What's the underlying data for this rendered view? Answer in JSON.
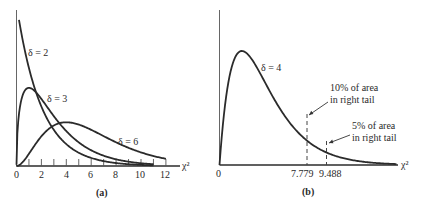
{
  "chart_data": [
    {
      "type": "line",
      "panel_label": "(a)",
      "title": "",
      "xlabel": "χ²",
      "ylabel": "",
      "xlim": [
        0,
        13
      ],
      "x_ticks": [
        0,
        1,
        2,
        3,
        4,
        5,
        6,
        7,
        8,
        9,
        10,
        11,
        12
      ],
      "x_tick_labels": [
        "0",
        "2",
        "4",
        "6",
        "8",
        "10",
        "12"
      ],
      "grid": false,
      "legend": "inline labels",
      "series": [
        {
          "name": "δ = 2",
          "label": "δ = 2",
          "distribution": "chi-square",
          "df": 2,
          "x_range": [
            0.2,
            11
          ]
        },
        {
          "name": "δ = 3",
          "label": "δ = 3",
          "distribution": "chi-square",
          "df": 3,
          "x_range": [
            0,
            11
          ]
        },
        {
          "name": "δ = 6",
          "label": "δ = 6",
          "distribution": "chi-square",
          "df": 6,
          "x_range": [
            0,
            12
          ]
        }
      ]
    },
    {
      "type": "line",
      "panel_label": "(b)",
      "title": "",
      "xlabel": "χ²",
      "ylabel": "",
      "xlim": [
        0,
        16
      ],
      "x_tick_labels": [
        "0",
        "7.779",
        "9.488"
      ],
      "grid": false,
      "series": [
        {
          "name": "δ = 4",
          "label": "δ = 4",
          "distribution": "chi-square",
          "df": 4,
          "x_range": [
            0,
            15.8
          ]
        }
      ],
      "critical_values": [
        {
          "x": 7.779,
          "label": "7.779",
          "annotation": [
            "10% of area",
            "in right tail"
          ]
        },
        {
          "x": 9.488,
          "label": "9.488",
          "annotation": [
            "5% of area",
            "in right tail"
          ]
        }
      ]
    }
  ],
  "panel_a": {
    "caption": "(a)",
    "axis_label": "χ²",
    "tick_labels": [
      "0",
      "2",
      "4",
      "6",
      "8",
      "10",
      "12"
    ],
    "curve_labels": [
      "δ = 2",
      "δ = 3",
      "δ = 6"
    ]
  },
  "panel_b": {
    "caption": "(b)",
    "axis_label": "χ²",
    "origin_label": "0",
    "curve_label": "δ = 4",
    "crit1_label": "7.779",
    "crit2_label": "9.488",
    "note1_line1": "10% of area",
    "note1_line2": "in right tail",
    "note2_line1": "5% of area",
    "note2_line2": "in right tail"
  }
}
